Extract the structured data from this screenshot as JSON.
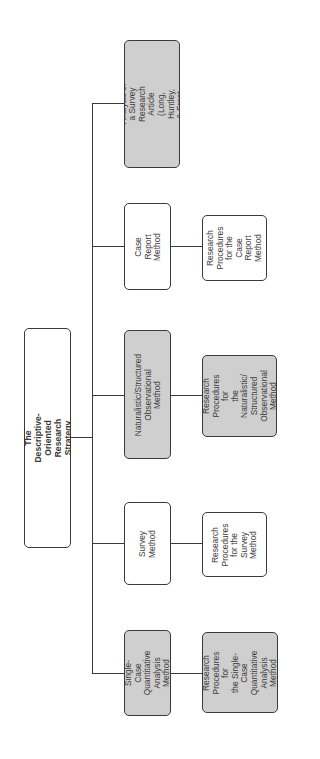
{
  "diagram": {
    "orientation": "rotated-90-ccw",
    "colors": {
      "line": "#3a3a3a",
      "gray_fill": "#cfcfcf",
      "white_fill": "#ffffff"
    },
    "root": {
      "label": "The Descriptive-Oriented\nResearch Strategy",
      "fill": "white"
    },
    "methods": [
      {
        "label": "Single-Case\nQuantitative\nAnalysis Method",
        "fill": "gray",
        "procedure": {
          "label": "Research\nProcedures for\nthe Single-Case\nQuantitative\nAnalysis\nMethod",
          "fill": "gray"
        }
      },
      {
        "label": "Survey\nMethod",
        "fill": "white",
        "procedure": {
          "label": "Research\nProcedures\nfor the\nSurvey\nMethod",
          "fill": "white"
        }
      },
      {
        "label": "Naturalistic/Structured\nObservational\nMethod",
        "fill": "gray",
        "procedure": {
          "label": "Research\nProcedures for\nthe Naturalistic/\nStructured\nObservational\nMethod",
          "fill": "gray"
        }
      },
      {
        "label": "Case Report\nMethod",
        "fill": "white",
        "procedure": {
          "label": "Research\nProcedures\nfor the\nCase Report\nMethod",
          "fill": "white"
        }
      },
      {
        "label": "Abbreviated Analysis of\na Survey Research\nArticle (Long, Huntley,\n& Ernst, 2001)",
        "fill": "gray",
        "procedure": null
      }
    ]
  }
}
